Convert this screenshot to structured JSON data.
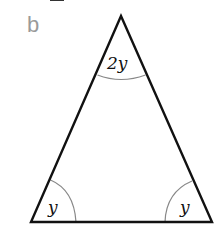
{
  "part_label": "b",
  "triangle": {
    "vertices": {
      "apex": [
        121,
        16
      ],
      "bottom_left": [
        31,
        222
      ],
      "bottom_right": [
        212,
        222
      ]
    },
    "stroke_color": "#111111",
    "arc_color": "#888888"
  },
  "angles": {
    "apex": "2y",
    "bottom_left": "y",
    "bottom_right": "y"
  }
}
